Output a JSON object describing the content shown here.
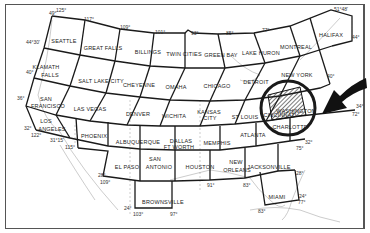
{
  "map": {
    "title": "Sectional Aeronautical Chart Index",
    "charts": [
      {
        "name": "SEATTLE",
        "x": 64,
        "y": 38
      },
      {
        "name": "GREAT FALLS",
        "x": 103,
        "y": 45
      },
      {
        "name": "BILLINGS",
        "x": 148,
        "y": 49
      },
      {
        "name": "TWIN CITIES",
        "x": 184,
        "y": 51
      },
      {
        "name": "GREEN BAY",
        "x": 221,
        "y": 52
      },
      {
        "name": "LAKE HURON",
        "x": 261,
        "y": 50
      },
      {
        "name": "MONTREAL",
        "x": 296,
        "y": 44
      },
      {
        "name": "HALIFAX",
        "x": 331,
        "y": 32
      },
      {
        "name": "KLAMATH",
        "x": 46,
        "y": 64
      },
      {
        "name": "FALLS",
        "x": 50,
        "y": 72
      },
      {
        "name": "SALT LAKE CITY",
        "x": 101,
        "y": 78
      },
      {
        "name": "CHEYENNE",
        "x": 139,
        "y": 82
      },
      {
        "name": "OMAHA",
        "x": 176,
        "y": 84
      },
      {
        "name": "CHICAGO",
        "x": 217,
        "y": 83
      },
      {
        "name": "DETROIT",
        "x": 256,
        "y": 79
      },
      {
        "name": "NEW YORK",
        "x": 297,
        "y": 72
      },
      {
        "name": "SAN",
        "x": 46,
        "y": 96
      },
      {
        "name": "FRANCISCO",
        "x": 48,
        "y": 103
      },
      {
        "name": "LAS VEGAS",
        "x": 90,
        "y": 106
      },
      {
        "name": "DENVER",
        "x": 138,
        "y": 111
      },
      {
        "name": "WICHITA",
        "x": 174,
        "y": 113
      },
      {
        "name": "KANSAS",
        "x": 209,
        "y": 109
      },
      {
        "name": "CITY",
        "x": 210,
        "y": 115
      },
      {
        "name": "ST LOUIS",
        "x": 245,
        "y": 114
      },
      {
        "name": "CINCINNATI",
        "x": 280,
        "y": 112
      },
      {
        "name": "WASHINGTON",
        "x": 296,
        "y": 108
      },
      {
        "name": "LOS",
        "x": 46,
        "y": 118
      },
      {
        "name": "ANGELES",
        "x": 52,
        "y": 126
      },
      {
        "name": "PHOENIX",
        "x": 94,
        "y": 133
      },
      {
        "name": "ALBUQUERQUE",
        "x": 138,
        "y": 139
      },
      {
        "name": "DALLAS",
        "x": 181,
        "y": 138
      },
      {
        "name": "FT WORTH",
        "x": 179,
        "y": 144
      },
      {
        "name": "MEMPHIS",
        "x": 217,
        "y": 140
      },
      {
        "name": "ATLANTA",
        "x": 253,
        "y": 132
      },
      {
        "name": "CHARLOTTE",
        "x": 290,
        "y": 124
      },
      {
        "name": "EL PASO",
        "x": 127,
        "y": 164
      },
      {
        "name": "SAN",
        "x": 155,
        "y": 156
      },
      {
        "name": "ANTONIO",
        "x": 159,
        "y": 164
      },
      {
        "name": "HOUSTON",
        "x": 200,
        "y": 164
      },
      {
        "name": "NEW",
        "x": 236,
        "y": 159
      },
      {
        "name": "ORLEANS",
        "x": 237,
        "y": 167
      },
      {
        "name": "JACKSONVILLE",
        "x": 269,
        "y": 164
      },
      {
        "name": "BROWNSVILLE",
        "x": 163,
        "y": 199
      },
      {
        "name": "MIAMI",
        "x": 277,
        "y": 194
      }
    ],
    "degree_labels": [
      {
        "text": "49°",
        "x": 49,
        "y": 11
      },
      {
        "text": "125°",
        "x": 56,
        "y": 8
      },
      {
        "text": "117°",
        "x": 84,
        "y": 17
      },
      {
        "text": "109°",
        "x": 120,
        "y": 25
      },
      {
        "text": "101°",
        "x": 155,
        "y": 30
      },
      {
        "text": "93°",
        "x": 191,
        "y": 31
      },
      {
        "text": "85°",
        "x": 226,
        "y": 31
      },
      {
        "text": "77°",
        "x": 262,
        "y": 28
      },
      {
        "text": "51°48'",
        "x": 334,
        "y": 7
      },
      {
        "text": "44°",
        "x": 352,
        "y": 35
      },
      {
        "text": "44°30'",
        "x": 26,
        "y": 40
      },
      {
        "text": "40°",
        "x": 26,
        "y": 70
      },
      {
        "text": "40°",
        "x": 327,
        "y": 74
      },
      {
        "text": "36°",
        "x": 17,
        "y": 96
      },
      {
        "text": "34°",
        "x": 356,
        "y": 104
      },
      {
        "text": "32°",
        "x": 24,
        "y": 126
      },
      {
        "text": "122°",
        "x": 31,
        "y": 133
      },
      {
        "text": "31°15'",
        "x": 50,
        "y": 138
      },
      {
        "text": "115°",
        "x": 65,
        "y": 145
      },
      {
        "text": "72°",
        "x": 352,
        "y": 112
      },
      {
        "text": "32°",
        "x": 305,
        "y": 140
      },
      {
        "text": "75°",
        "x": 296,
        "y": 146
      },
      {
        "text": "28°",
        "x": 98,
        "y": 173
      },
      {
        "text": "109°",
        "x": 100,
        "y": 180
      },
      {
        "text": "91°",
        "x": 207,
        "y": 183
      },
      {
        "text": "83°",
        "x": 243,
        "y": 183
      },
      {
        "text": "28°",
        "x": 296,
        "y": 171
      },
      {
        "text": "24°",
        "x": 124,
        "y": 206
      },
      {
        "text": "103°",
        "x": 133,
        "y": 212
      },
      {
        "text": "97°",
        "x": 170,
        "y": 212
      },
      {
        "text": "24°",
        "x": 299,
        "y": 194
      },
      {
        "text": "77°",
        "x": 298,
        "y": 200
      },
      {
        "text": "83°",
        "x": 258,
        "y": 209
      }
    ],
    "highlight": {
      "chart": "WASHINGTON",
      "circle_color": "#1a1a1a",
      "arrow_color": "#111111"
    }
  }
}
